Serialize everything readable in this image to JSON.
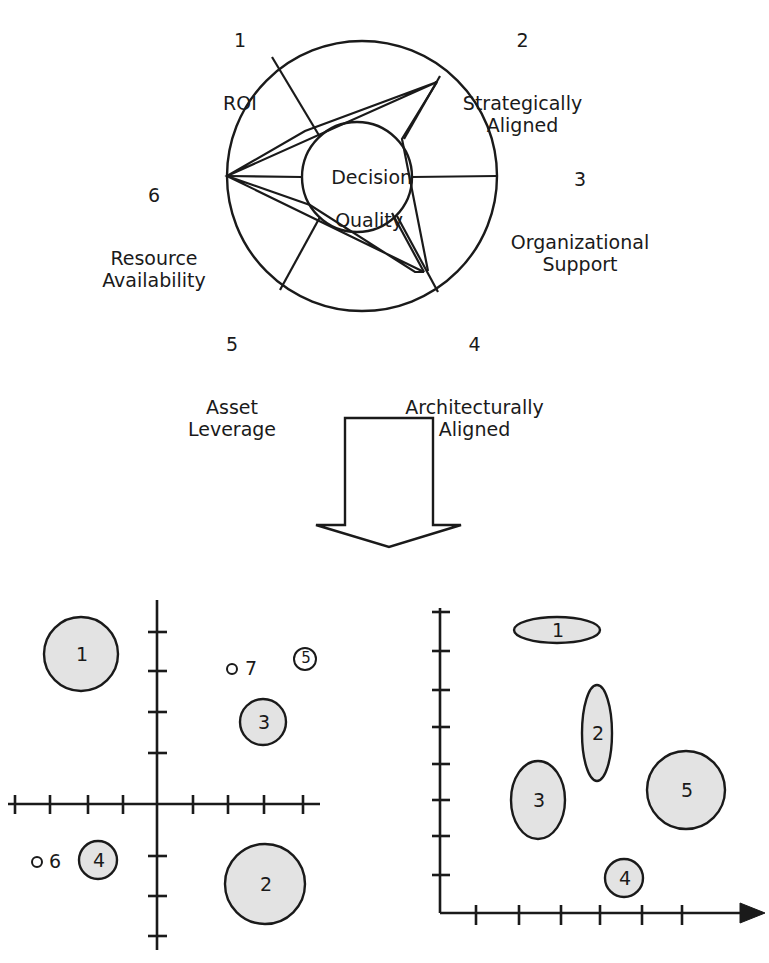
{
  "figure": {
    "title": "",
    "type": "diagram"
  },
  "radar": {
    "center_label_line1": "Decision",
    "center_label_line2": "Quality",
    "dimensions": [
      {
        "number": "1",
        "name": "ROI"
      },
      {
        "number": "2",
        "name": "Strategically\nAligned"
      },
      {
        "number": "3",
        "name": "Organizational\nSupport"
      },
      {
        "number": "4",
        "name": "Architecturally\nAligned"
      },
      {
        "number": "5",
        "name": "Asset\nLeverage"
      },
      {
        "number": "6",
        "name": "Resource\nAvailability"
      }
    ]
  },
  "arrow": {
    "direction": "down",
    "name": "down-arrow"
  },
  "chart_data": [
    {
      "type": "scatter",
      "name": "four-quadrant-bubble-plot",
      "title": "",
      "xlabel": "",
      "ylabel": "",
      "axes": "four-quadrant-cross",
      "grid": false,
      "legend": false,
      "xlim": [
        -5,
        5
      ],
      "ylim": [
        -4,
        4
      ],
      "x_ticks": [
        -4,
        -3,
        -2,
        -1,
        1,
        2,
        3,
        4
      ],
      "y_ticks": [
        -3,
        -2,
        -1,
        1,
        2,
        3
      ],
      "points": [
        {
          "label": "1",
          "x": -2.9,
          "y": 2.45,
          "size": 60,
          "shape": "circle",
          "filled": true
        },
        {
          "label": "2",
          "x": 2.6,
          "y": -2.1,
          "size": 64,
          "shape": "circle",
          "filled": true
        },
        {
          "label": "3",
          "x": 1.7,
          "y": 1.2,
          "size": 38,
          "shape": "circle",
          "filled": true
        },
        {
          "label": "4",
          "x": -1.9,
          "y": -1.25,
          "size": 30,
          "shape": "circle",
          "filled": true
        },
        {
          "label": "5",
          "x": 2.8,
          "y": 2.3,
          "size": 14,
          "shape": "circle",
          "filled": false
        },
        {
          "label": "6",
          "x": -4.2,
          "y": -1.25,
          "size": 5,
          "shape": "circle",
          "filled": false
        },
        {
          "label": "7",
          "x": 1.1,
          "y": 2.25,
          "size": 5,
          "shape": "circle",
          "filled": false
        }
      ]
    },
    {
      "type": "scatter",
      "name": "first-quadrant-ellipse-plot",
      "title": "",
      "xlabel": "",
      "ylabel": "",
      "axes": "L-shaped-with-arrowhead",
      "grid": false,
      "legend": false,
      "xlim": [
        0,
        7
      ],
      "ylim": [
        0,
        8
      ],
      "x_ticks": [
        1,
        2,
        3,
        4,
        5,
        6
      ],
      "y_ticks": [
        1,
        2,
        3,
        4,
        5,
        6,
        7
      ],
      "points": [
        {
          "label": "1",
          "x": 2.3,
          "y": 7.1,
          "rx": 42,
          "ry": 12,
          "shape": "ellipse",
          "filled": true
        },
        {
          "label": "2",
          "x": 3.5,
          "y": 4.55,
          "rx": 14,
          "ry": 50,
          "shape": "ellipse",
          "filled": true
        },
        {
          "label": "3",
          "x": 2.4,
          "y": 3.0,
          "rx": 27,
          "ry": 38,
          "shape": "ellipse",
          "filled": true
        },
        {
          "label": "4",
          "x": 3.9,
          "y": 1.55,
          "rx": 18,
          "ry": 18,
          "shape": "ellipse",
          "filled": true
        },
        {
          "label": "5",
          "x": 5.4,
          "y": 3.4,
          "rx": 39,
          "ry": 39,
          "shape": "ellipse",
          "filled": true
        }
      ]
    }
  ],
  "colors": {
    "stroke": "#1a1a1a",
    "bubble_fill": "#e3e3e3",
    "background": "#ffffff"
  }
}
